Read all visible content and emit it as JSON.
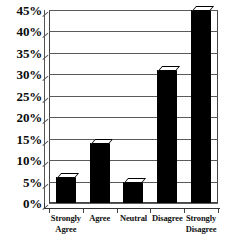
{
  "chart_data": {
    "type": "bar",
    "title": "",
    "xlabel": "",
    "ylabel": "",
    "categories": [
      "Strongly Agree",
      "Agree",
      "Neutral",
      "Disagree",
      "Strongly Disagree"
    ],
    "category_lines": [
      [
        "Strongly",
        "Agree"
      ],
      [
        "Agree"
      ],
      [
        "Neutral"
      ],
      [
        "Disagree"
      ],
      [
        "Strongly",
        "Disagree"
      ]
    ],
    "values": [
      6,
      14,
      5,
      31,
      45
    ],
    "value_labels": [
      "6%",
      "14%",
      "5%",
      "31%",
      "45%"
    ],
    "ylim": [
      0,
      45
    ],
    "ytick_step": 5,
    "ytick_labels": [
      "45%",
      "40%",
      "35%",
      "30%",
      "25%",
      "20%",
      "15%",
      "10%",
      "5%",
      "0%"
    ],
    "ytick_values": [
      45,
      40,
      35,
      30,
      25,
      20,
      15,
      10,
      5,
      0
    ],
    "grid": true,
    "legend": false,
    "legend_position": "none",
    "bar_color": "#000000",
    "bar_top_color": "#ffffff",
    "grid_color": "#5a5a5a",
    "axis_color": "#333333",
    "background": "#ffffff",
    "style": "3d-bar"
  }
}
